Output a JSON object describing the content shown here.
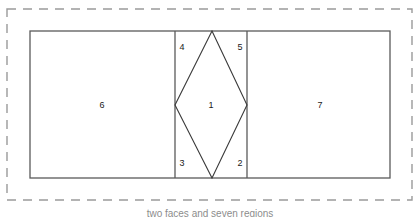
{
  "figure": {
    "caption": "two faces and seven regions",
    "background_color": "#ffffff",
    "outer_boundary": {
      "name": "dashed-bounding-box",
      "style": "dashed",
      "color": "#9a9a9a",
      "x": 7,
      "y": 9,
      "width": 405,
      "height": 191
    },
    "main_rectangle": {
      "name": "outer-rectangle",
      "style": "solid",
      "color": "#5a5a5a",
      "x": 30,
      "y": 31,
      "width": 360,
      "height": 147
    },
    "dividers": [
      {
        "name": "left-divider",
        "x1": 175,
        "y1": 31,
        "x2": 175,
        "y2": 178,
        "color": "#5a5a5a"
      },
      {
        "name": "right-divider",
        "x1": 247,
        "y1": 31,
        "x2": 247,
        "y2": 178,
        "color": "#5a5a5a"
      }
    ],
    "diamond": {
      "name": "central-diamond",
      "color": "#3a3a3a",
      "vertices": [
        {
          "label": "top",
          "x": 212,
          "y": 31
        },
        {
          "label": "right",
          "x": 247,
          "y": 105
        },
        {
          "label": "bottom",
          "x": 212,
          "y": 178
        },
        {
          "label": "left",
          "x": 175,
          "y": 105
        }
      ]
    },
    "regions": [
      {
        "id": "region-6",
        "label": "6",
        "x": 102,
        "y": 105
      },
      {
        "id": "region-4",
        "label": "4",
        "x": 182,
        "y": 47
      },
      {
        "id": "region-5",
        "label": "5",
        "x": 240,
        "y": 47
      },
      {
        "id": "region-1",
        "label": "1",
        "x": 211,
        "y": 105
      },
      {
        "id": "region-3",
        "label": "3",
        "x": 182,
        "y": 163
      },
      {
        "id": "region-2",
        "label": "2",
        "x": 240,
        "y": 163
      },
      {
        "id": "region-7",
        "label": "7",
        "x": 320,
        "y": 105
      }
    ]
  }
}
